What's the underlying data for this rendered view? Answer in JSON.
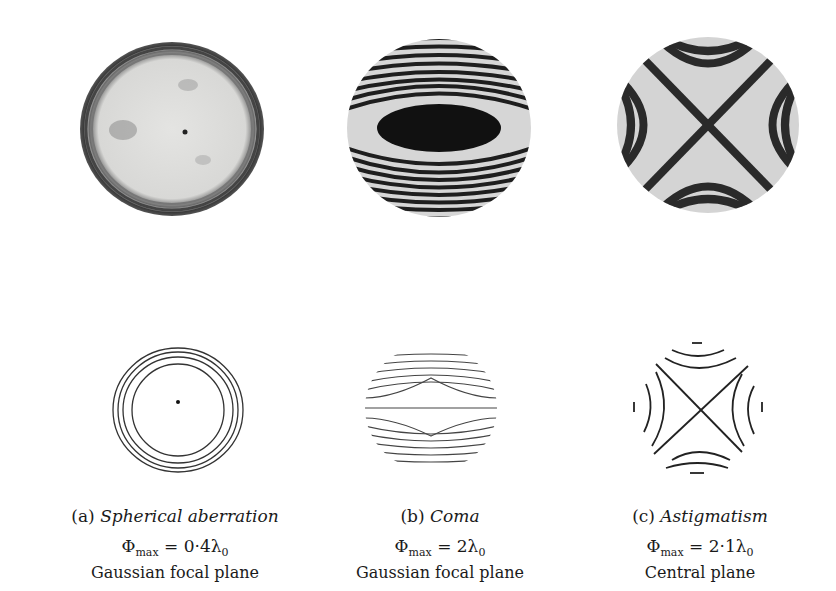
{
  "figure": {
    "panels": [
      {
        "id": "a",
        "label": "(a)",
        "name": "Spherical aberration",
        "phi_symbol": "Φ",
        "phi_sub": "max",
        "phi_eq": " = 0·4λ",
        "phi_eq_sub": "0",
        "plane": "Gaussian focal plane",
        "photo_desc": "interferogram-spherical",
        "drawing_desc": "concentric-rings"
      },
      {
        "id": "b",
        "label": "(b)",
        "name": "Coma",
        "phi_symbol": "Φ",
        "phi_sub": "max",
        "phi_eq": " = 2λ",
        "phi_eq_sub": "0",
        "plane": "Gaussian focal plane",
        "photo_desc": "interferogram-coma",
        "drawing_desc": "coma-fringes"
      },
      {
        "id": "c",
        "label": "(c)",
        "name": "Astigmatism",
        "phi_symbol": "Φ",
        "phi_sub": "max",
        "phi_eq": " = 2·1λ",
        "phi_eq_sub": "0",
        "plane": "Central plane",
        "photo_desc": "interferogram-astigmatism",
        "drawing_desc": "hyperbolic-fringes-cross"
      }
    ]
  }
}
